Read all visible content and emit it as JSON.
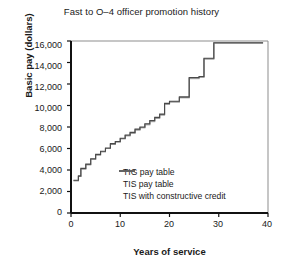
{
  "chart_data": {
    "type": "line",
    "title": "Fast to O–4 officer promotion history",
    "xlabel": "Years of service",
    "ylabel": "Basic pay (dollars)",
    "xlim": [
      0,
      40
    ],
    "ylim": [
      0,
      16000
    ],
    "grid": false,
    "legend_position": "inside-lower-center",
    "xticks": [
      0,
      10,
      20,
      30,
      40
    ],
    "xtick_labels": [
      "0",
      "10",
      "20",
      "30",
      "40"
    ],
    "yticks": [
      0,
      2000,
      4000,
      6000,
      8000,
      10000,
      12000,
      14000,
      16000
    ],
    "ytick_labels": [
      "0",
      "2,000",
      "4,000",
      "6,000",
      "8,000",
      "10,000",
      "12,000",
      "14,000",
      "16,000"
    ],
    "step_shape": "hv",
    "colors": {
      "tig": "#b9b9b9",
      "tis": "#8a8a8a",
      "tis_cc": "#4a4a4a",
      "axis": "#111111",
      "frame": "#8d8d8d",
      "text": "#1a1a1a"
    },
    "series": [
      {
        "name": "TIG pay table",
        "color": "#b9b9b9",
        "x": [
          0.5,
          1.5,
          2.0,
          3.0,
          4.0,
          5.0,
          6.0,
          7.0,
          8.0,
          9.0,
          10.0,
          11.0,
          12.0,
          13.0,
          14.0,
          15.0,
          16.0,
          17.0,
          18.0,
          19.0,
          20.0,
          22.0,
          24.0,
          26.0,
          27.0,
          29.0,
          39.0
        ],
        "y": [
          3000,
          3400,
          4100,
          4500,
          5000,
          5400,
          5700,
          6000,
          6400,
          6600,
          6900,
          7200,
          7400,
          7700,
          7900,
          8200,
          8500,
          8800,
          9100,
          10100,
          10300,
          10700,
          12500,
          12600,
          14300,
          15800,
          15800
        ]
      },
      {
        "name": "TIS pay table",
        "color": "#8a8a8a",
        "x": [
          0.5,
          1.5,
          2.0,
          3.0,
          4.0,
          5.0,
          6.0,
          7.0,
          8.0,
          9.0,
          10.0,
          11.0,
          12.0,
          13.0,
          14.0,
          15.0,
          16.0,
          17.0,
          18.0,
          19.0,
          20.0,
          22.0,
          24.0,
          26.0,
          27.0,
          29.0,
          39.0
        ],
        "y": [
          3000,
          3400,
          4100,
          4500,
          5000,
          5400,
          5700,
          6000,
          6400,
          6600,
          6900,
          7200,
          7450,
          7750,
          7950,
          8250,
          8550,
          8850,
          9150,
          10150,
          10350,
          10750,
          12550,
          12650,
          14350,
          15820,
          15820
        ]
      },
      {
        "name": "TIS with constructive credit",
        "color": "#4a4a4a",
        "x": [
          0.5,
          1.5,
          2.0,
          3.0,
          4.0,
          5.0,
          6.0,
          7.0,
          8.0,
          9.0,
          10.0,
          11.0,
          12.0,
          13.0,
          14.0,
          15.0,
          16.0,
          17.0,
          18.0,
          19.0,
          20.0,
          22.0,
          24.0,
          26.0,
          27.0,
          29.0,
          39.0
        ],
        "y": [
          3050,
          3450,
          4150,
          4550,
          5050,
          5450,
          5750,
          6050,
          6450,
          6650,
          6950,
          7250,
          7500,
          7800,
          8000,
          8300,
          8600,
          8900,
          9200,
          10200,
          10400,
          10800,
          12600,
          12700,
          14400,
          15840,
          15840
        ]
      }
    ],
    "legend": [
      {
        "label": "TIG pay table",
        "color": "#b9b9b9"
      },
      {
        "label": "TIS pay table",
        "color": "#8a8a8a"
      },
      {
        "label": "TIS with constructive credit",
        "color": "#4a4a4a"
      }
    ]
  }
}
